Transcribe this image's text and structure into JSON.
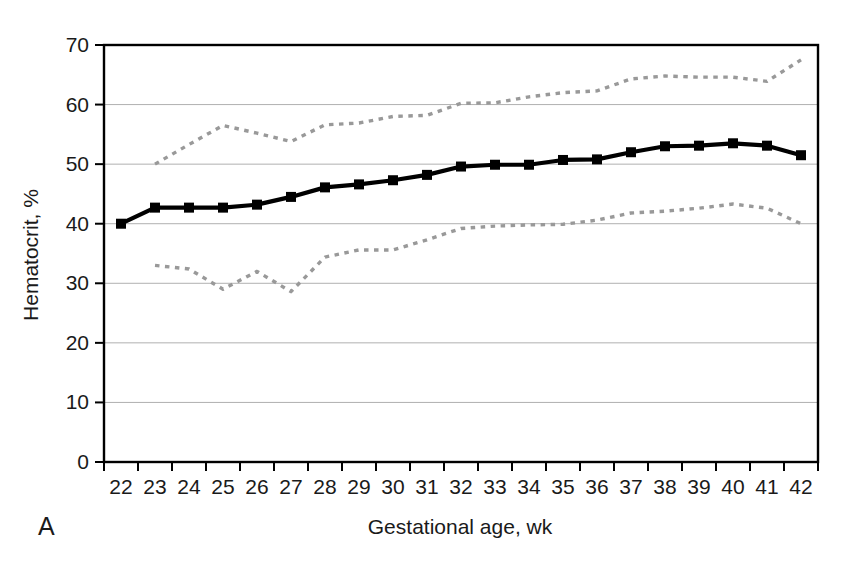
{
  "panel": {
    "letter": "A"
  },
  "chart_data": {
    "type": "line",
    "title": "",
    "xlabel": "Gestational age, wk",
    "ylabel": "Hematocrit, %",
    "xlim": [
      21.5,
      42.5
    ],
    "ylim": [
      0,
      70
    ],
    "ytick_values": [
      0,
      10,
      20,
      30,
      40,
      50,
      60,
      70
    ],
    "ytick_labels": [
      "0",
      "10",
      "20",
      "30",
      "40",
      "50",
      "60",
      "70"
    ],
    "xtick_values": [
      22,
      23,
      24,
      25,
      26,
      27,
      28,
      29,
      30,
      31,
      32,
      33,
      34,
      35,
      36,
      37,
      38,
      39,
      40,
      41,
      42
    ],
    "xtick_labels": [
      "22",
      "23",
      "24",
      "25",
      "26",
      "27",
      "28",
      "29",
      "30",
      "31",
      "32",
      "33",
      "34",
      "35",
      "36",
      "37",
      "38",
      "39",
      "40",
      "41",
      "42"
    ],
    "grid": "horizontal",
    "legend_position": "none",
    "colors": {
      "mean_line": "#000000",
      "percentile_band": "#999999",
      "gridline": "#b0b0b0",
      "axis": "#000000"
    },
    "series": [
      {
        "name": "Mean hematocrit",
        "style": "solid",
        "marker": "square",
        "color": "#000000",
        "x": [
          22,
          23,
          24,
          25,
          26,
          27,
          28,
          29,
          30,
          31,
          32,
          33,
          34,
          35,
          36,
          37,
          38,
          39,
          40,
          41,
          42
        ],
        "values": [
          40.0,
          42.7,
          42.7,
          42.7,
          43.2,
          44.5,
          46.1,
          46.6,
          47.3,
          48.2,
          49.6,
          49.9,
          49.9,
          50.7,
          50.8,
          52.0,
          53.0,
          53.1,
          53.5,
          53.1,
          51.5
        ]
      },
      {
        "name": "Upper percentile",
        "style": "dashed",
        "marker": "none",
        "color": "#999999",
        "x": [
          23,
          24,
          25,
          26,
          27,
          28,
          29,
          30,
          31,
          32,
          33,
          34,
          35,
          36,
          37,
          38,
          39,
          40,
          41,
          42
        ],
        "values": [
          50.0,
          53.3,
          56.5,
          55.2,
          53.8,
          56.6,
          56.9,
          58.0,
          58.2,
          60.2,
          60.3,
          61.3,
          62.0,
          62.3,
          64.3,
          64.8,
          64.6,
          64.6,
          63.9,
          67.5
        ]
      },
      {
        "name": "Lower percentile",
        "style": "dashed",
        "marker": "none",
        "color": "#999999",
        "x": [
          23,
          24,
          25,
          26,
          27,
          28,
          29,
          30,
          31,
          32,
          33,
          34,
          35,
          36,
          37,
          38,
          39,
          40,
          41,
          42
        ],
        "values": [
          33.0,
          32.4,
          29.0,
          32.0,
          28.6,
          34.4,
          35.6,
          35.6,
          37.3,
          39.2,
          39.6,
          39.8,
          39.9,
          40.6,
          41.8,
          42.1,
          42.6,
          43.3,
          42.6,
          40.0
        ]
      }
    ]
  }
}
